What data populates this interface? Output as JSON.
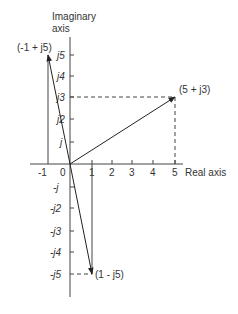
{
  "diagram": {
    "axes": {
      "imaginary_label_line1": "Imaginary",
      "imaginary_label_line2": "axis",
      "real_label": "Real axis"
    },
    "real_ticks": [
      "-1",
      "0",
      "1",
      "2",
      "3",
      "4",
      "5"
    ],
    "imag_ticks_pos": [
      "j",
      "j2",
      "j3",
      "j4",
      "j5"
    ],
    "imag_ticks_neg": [
      "-j",
      "-j2",
      "-j3",
      "-j4",
      "-j5"
    ],
    "points": [
      {
        "label": "(5 + j3)",
        "re": 5,
        "im": 3
      },
      {
        "label": "(-1 + j5)",
        "re": -1,
        "im": 5
      },
      {
        "label": "(1 - j5)",
        "re": 1,
        "im": -5
      }
    ],
    "colors": {
      "line": "#333333",
      "background": "#ffffff"
    }
  }
}
